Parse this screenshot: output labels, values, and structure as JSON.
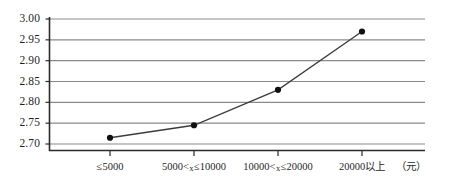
{
  "chart_data": {
    "type": "line",
    "title": "",
    "subtitle": "",
    "xlabel": "",
    "ylabel": "",
    "unit_label": "（元）",
    "categories": [
      "≤5000",
      "5000<x≤10000",
      "10000<x≤20000",
      "20000以上"
    ],
    "values": [
      2.715,
      2.745,
      2.83,
      2.97
    ],
    "ylim": [
      2.7,
      3.0
    ],
    "yticks": [
      "2.70",
      "2.75",
      "2.80",
      "2.85",
      "2.90",
      "2.95",
      "3.00"
    ],
    "ytick_values": [
      2.7,
      2.75,
      2.8,
      2.85,
      2.9,
      2.95,
      3.0
    ],
    "grid": true,
    "legend": "none",
    "series": [
      {
        "name": "",
        "values": [
          2.715,
          2.745,
          2.83,
          2.97
        ]
      }
    ],
    "colors": {
      "line": "#3c3c3c",
      "marker": "#101010",
      "gridline": "#8a8a8a",
      "axis": "#2b2b2b",
      "background": "#ffffff",
      "text": "#1f1f1f"
    },
    "category_parts": [
      {
        "prefix": "≤5000",
        "sub": "",
        "suffix": ""
      },
      {
        "prefix": "5000<",
        "sub": "x",
        "suffix": "≤10000"
      },
      {
        "prefix": "10000<",
        "sub": "x",
        "suffix": "≤20000"
      },
      {
        "prefix": "20000以上",
        "sub": "",
        "suffix": ""
      }
    ]
  }
}
